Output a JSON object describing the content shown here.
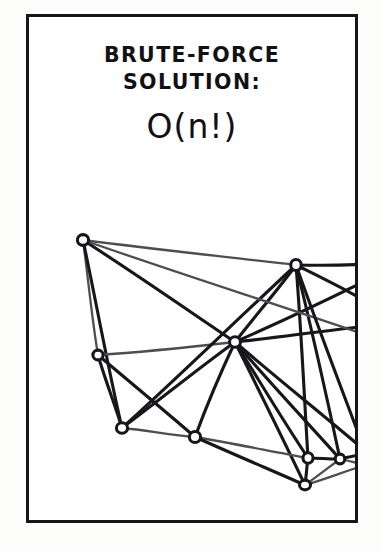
{
  "panel": {
    "name": "brute-force-solution-comic-panel",
    "background_color": "#ffffff",
    "page_background_color": "#fdfdfc",
    "border_color": "#16161a",
    "border_width_px": 3,
    "frame": {
      "x": 26,
      "y": 14,
      "width": 332,
      "height": 509
    }
  },
  "caption": {
    "line_1": "BRUTE-FORCE",
    "line_2": "SOLUTION:",
    "complexity": "O(n!)"
  },
  "graph": {
    "title": "hand-drawn complete-ish graph",
    "ink_color": "#17171b",
    "light_ink_color": "#4d4d52",
    "node_fill": "#ffffff",
    "node_radius": 5.2,
    "nodes": [
      {
        "id": "n1",
        "label": "top-left-node",
        "x": 54,
        "y": 223
      },
      {
        "id": "n2",
        "label": "left-mid-node",
        "x": 69,
        "y": 338
      },
      {
        "id": "n3",
        "label": "left-lower-node",
        "x": 93,
        "y": 411
      },
      {
        "id": "n4",
        "label": "hub-node",
        "x": 206,
        "y": 325
      },
      {
        "id": "n5",
        "label": "upper-right-node",
        "x": 267,
        "y": 248
      },
      {
        "id": "n6",
        "label": "bottom-mid-node",
        "x": 166,
        "y": 420
      },
      {
        "id": "n7",
        "label": "bottom-right-node",
        "x": 279,
        "y": 441
      },
      {
        "id": "n8",
        "label": "right-edge-node",
        "x": 311,
        "y": 442
      },
      {
        "id": "n9",
        "label": "bottom-apex-node",
        "x": 276,
        "y": 468
      }
    ],
    "edges": [
      {
        "from": "n1",
        "to": "n5",
        "weight": "light"
      },
      {
        "from": "n1",
        "to": "n2",
        "weight": "light"
      },
      {
        "from": "n1",
        "to": "n3",
        "weight": "bold"
      },
      {
        "from": "n1",
        "to": "n4",
        "weight": "bold"
      },
      {
        "from": "n2",
        "to": "n3",
        "weight": "bold"
      },
      {
        "from": "n2",
        "to": "n4",
        "weight": "light"
      },
      {
        "from": "n2",
        "to": "n6",
        "weight": "bold"
      },
      {
        "from": "n3",
        "to": "n4",
        "weight": "bold"
      },
      {
        "from": "n3",
        "to": "n6",
        "weight": "light"
      },
      {
        "from": "n3",
        "to": "n5",
        "weight": "bold"
      },
      {
        "from": "n4",
        "to": "n5",
        "weight": "bold"
      },
      {
        "from": "n4",
        "to": "n6",
        "weight": "bold"
      },
      {
        "from": "n4",
        "to": "n7",
        "weight": "bold"
      },
      {
        "from": "n4",
        "to": "n8",
        "weight": "bold"
      },
      {
        "from": "n4",
        "to": "n9",
        "weight": "bold"
      },
      {
        "from": "n5",
        "to": "n7",
        "weight": "bold"
      },
      {
        "from": "n5",
        "to": "n8",
        "weight": "bold"
      },
      {
        "from": "n6",
        "to": "n7",
        "weight": "light"
      },
      {
        "from": "n6",
        "to": "n9",
        "weight": "bold"
      },
      {
        "from": "n7",
        "to": "n8",
        "weight": "bold"
      },
      {
        "from": "n7",
        "to": "n9",
        "weight": "bold"
      },
      {
        "from": "n8",
        "to": "n9",
        "weight": "light"
      }
    ],
    "offpanel_edges": [
      {
        "from": "n5",
        "to_x": 340,
        "to_y": 247,
        "weight": "bold"
      },
      {
        "from": "n5",
        "to_x": 340,
        "to_y": 286,
        "weight": "bold"
      },
      {
        "from": "n4",
        "to_x": 340,
        "to_y": 262,
        "weight": "bold"
      },
      {
        "from": "n4",
        "to_x": 340,
        "to_y": 309,
        "weight": "bold"
      },
      {
        "from": "n4",
        "to_x": 340,
        "to_y": 437,
        "weight": "bold"
      },
      {
        "from": "n1",
        "to_x": 340,
        "to_y": 319,
        "weight": "light"
      },
      {
        "from": "n8",
        "to_x": 340,
        "to_y": 436,
        "weight": "bold"
      },
      {
        "from": "n8",
        "to_x": 340,
        "to_y": 449,
        "weight": "light"
      },
      {
        "from": "n9",
        "to_x": 340,
        "to_y": 447,
        "weight": "light"
      },
      {
        "from": "n5",
        "to_x": 340,
        "to_y": 445,
        "weight": "bold"
      }
    ]
  }
}
